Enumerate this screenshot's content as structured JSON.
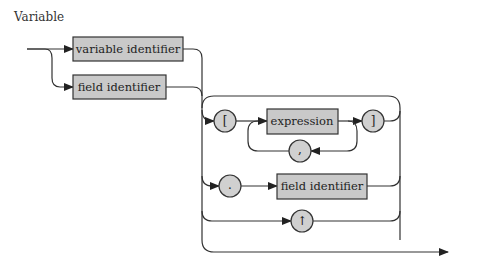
{
  "title": "Variable",
  "diagram": {
    "type": "syntax-diagram",
    "colors": {
      "box_fill": "#c9c9c9",
      "circle_fill": "#d0d0d0",
      "stroke": "#333333",
      "background": "#ffffff"
    },
    "boxes": [
      {
        "id": "variable-identifier",
        "label": "variable identifier"
      },
      {
        "id": "field-identifier-1",
        "label": "field identifier"
      },
      {
        "id": "expression",
        "label": "expression"
      },
      {
        "id": "field-identifier-2",
        "label": "field identifier"
      }
    ],
    "circles": [
      {
        "id": "open-bracket",
        "label": "["
      },
      {
        "id": "close-bracket",
        "label": "]"
      },
      {
        "id": "comma",
        "label": ","
      },
      {
        "id": "dot",
        "label": "."
      },
      {
        "id": "up-arrow",
        "label": "↑"
      }
    ]
  }
}
